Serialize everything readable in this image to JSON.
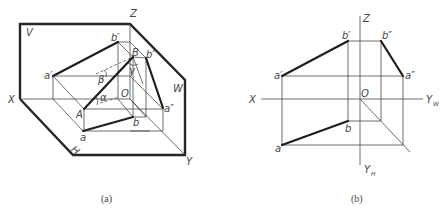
{
  "figure_a": {
    "caption": "(a)",
    "plane_labels": {
      "V": "V",
      "W": "W",
      "H": "H"
    },
    "axis_labels": {
      "X": "X",
      "Y": "Y",
      "Z": "Z",
      "O": "O"
    },
    "point_labels": {
      "a_prime": "a′",
      "b_prime": "b′",
      "a_dprime": "a″",
      "b_dprime": "b″",
      "a": "a",
      "b": "b",
      "A": "A",
      "B": "B"
    },
    "angle_labels": {
      "alpha": "α",
      "beta": "β",
      "gamma": "γ"
    }
  },
  "figure_b": {
    "caption": "(b)",
    "axis_labels": {
      "X": "X",
      "Z": "Z",
      "O": "O",
      "Y_W": "Y",
      "Y_W_sub": "W",
      "Y_H": "Y",
      "Y_H_sub": "H"
    },
    "point_labels": {
      "a_prime": "a′",
      "b_prime": "b′",
      "a_dprime": "a″",
      "b_dprime": "b″",
      "a": "a",
      "b": "b"
    }
  }
}
